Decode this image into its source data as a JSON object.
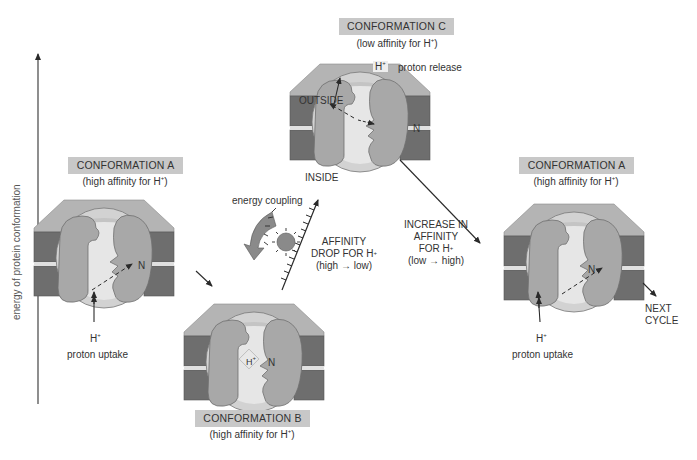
{
  "axis": {
    "label": "energy of protein conformation",
    "direction": "up"
  },
  "conformations": [
    {
      "id": "A_left",
      "title": "CONFORMATION A",
      "subtitle_prefix": "(high affinity for H",
      "subtitle_suffix": ")",
      "site_label": "N",
      "annotation": "proton uptake",
      "ion": "H"
    },
    {
      "id": "B",
      "title": "CONFORMATION B",
      "subtitle_prefix": "(high affinity for H",
      "subtitle_suffix": ")",
      "site_label": "N",
      "bound_ion": "H"
    },
    {
      "id": "C",
      "title": "CONFORMATION C",
      "subtitle_prefix": "(low affinity for H",
      "subtitle_suffix": ")",
      "site_label": "N",
      "annotation": "proton release",
      "ion": "H"
    },
    {
      "id": "A_right",
      "title": "CONFORMATION A",
      "subtitle_prefix": "(high affinity for H",
      "subtitle_suffix": ")",
      "site_label": "N",
      "annotation": "proton uptake",
      "ion": "H"
    }
  ],
  "superscript_plus": "+",
  "membrane": {
    "outside": "OUTSIDE",
    "inside": "INSIDE"
  },
  "energy_coupling": "energy coupling",
  "affinity_drop": {
    "line1": "AFFINITY",
    "line2_prefix": "DROP FOR H",
    "line3": "(high → low)"
  },
  "affinity_increase": {
    "line1": "INCREASE IN",
    "line2": "AFFINITY",
    "line3_prefix": "FOR H",
    "line4": "(low → high)"
  },
  "next_cycle": {
    "line1": "NEXT",
    "line2": "CYCLE"
  },
  "colors": {
    "label_box": "#c8c8c8",
    "membrane_dark": "#6e6e6e",
    "membrane_top": "#b4b4b4",
    "protein": "#a8a8a8",
    "cavity": "#dcdcdc",
    "cavity_light": "#ececec",
    "arrow": "#2a2a2a"
  }
}
